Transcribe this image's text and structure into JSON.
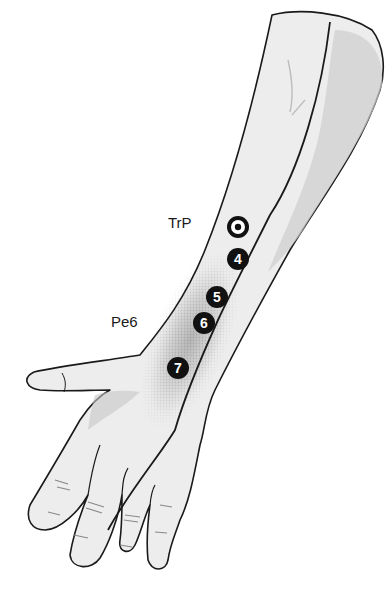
{
  "figure": {
    "labels": {
      "trp": "TrP",
      "pe6": "Pe6"
    },
    "points": [
      {
        "id": "trp",
        "label": "",
        "type": "target"
      },
      {
        "id": "p4",
        "label": "4"
      },
      {
        "id": "p5",
        "label": "5"
      },
      {
        "id": "p6",
        "label": "6"
      },
      {
        "id": "p7",
        "label": "7"
      }
    ],
    "colors": {
      "skin": "#ededed",
      "shadow": "#c8c8c8",
      "outline": "#1a1a1a",
      "point_fill": "#111111",
      "point_text": "#ffffff",
      "stipple": "#4a4a4a"
    }
  }
}
